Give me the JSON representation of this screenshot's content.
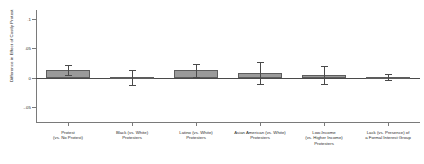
{
  "chart_data": {
    "type": "bar",
    "title": "",
    "xlabel": "",
    "ylabel": "Difference in Effect of Costly Protest",
    "ylim": [
      -0.075,
      0.115
    ],
    "yticks": [
      0.1,
      0.05,
      0,
      -0.05
    ],
    "ytick_labels": [
      ".1",
      ".05",
      "0",
      "-.05"
    ],
    "grid": false,
    "legend": false,
    "zero_reference_line": true,
    "categories": [
      "Protest\n(vs. No Protest)",
      "Black (vs. White)\nProtesters",
      "Latino (vs. White)\nProtesters",
      "Asian American (vs. White)\nProtesters",
      "Low-Income\n(vs. Higher Income)\nProtesters",
      "Lack (vs. Presence) of\na Formal Interest Group"
    ],
    "values": [
      0.0125,
      0.0005,
      0.0125,
      0.0085,
      0.0045,
      0.0008
    ],
    "err_low": [
      0.004,
      -0.012,
      0.001,
      -0.01,
      -0.011,
      -0.004
    ],
    "err_high": [
      0.021,
      0.013,
      0.024,
      0.027,
      0.02,
      0.006
    ],
    "bar_fill_color": "#9a9a9a",
    "bar_edge_color": "#5d5d5d",
    "error_bar_color": "#4a4a4a",
    "axis_color": "#7a7a7a"
  },
  "figure": {
    "background": "#ffffff"
  }
}
